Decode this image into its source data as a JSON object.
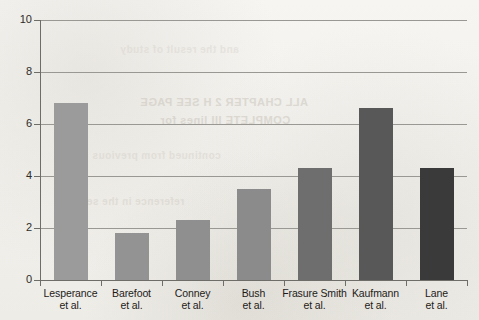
{
  "chart_data": {
    "type": "bar",
    "title": "",
    "xlabel": "",
    "ylabel": "",
    "ylim": [
      0,
      10
    ],
    "yticks": [
      0,
      2,
      4,
      6,
      8,
      10
    ],
    "grid": true,
    "legend": "none",
    "categories": [
      "Lesperance et al.",
      "Barefoot et al.",
      "Conney et al.",
      "Bush et al.",
      "Frasure Smith et al.",
      "Kaufmann et al.",
      "Lane et al."
    ],
    "category_lines": [
      [
        "Lesperance",
        "et al."
      ],
      [
        "Barefoot",
        "et al."
      ],
      [
        "Conney",
        "et al."
      ],
      [
        "Bush",
        "et al."
      ],
      [
        "Frasure Smith",
        "et al."
      ],
      [
        "Kaufmann",
        "et al."
      ],
      [
        "Lane",
        "et al."
      ]
    ],
    "values": [
      6.8,
      1.8,
      2.3,
      3.5,
      4.3,
      6.6,
      4.3
    ],
    "bar_colors": [
      "#9b9b9b",
      "#939393",
      "#8f8f8f",
      "#8b8b8b",
      "#6e6e6e",
      "#585858",
      "#3a3a3a"
    ],
    "axis_color": "#6f6d68",
    "grid_color": "#9a9892",
    "background_color": "#f2f1ed"
  },
  "bleed_through": {
    "line1": "ALL CHAPTER 2 H SEE PAGE",
    "line2": "COMPLETE III lines for",
    "line3": "reference in the section",
    "line4": "continued from previous",
    "line5": "and the result of study"
  }
}
